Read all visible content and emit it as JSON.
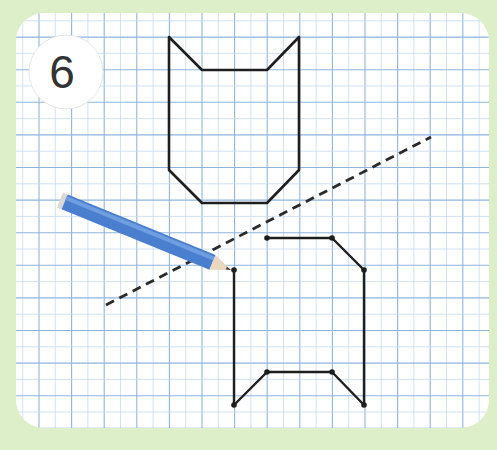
{
  "puzzle": {
    "number": "6",
    "caption": ""
  },
  "colors": {
    "background": "#dcefc9",
    "board": "#ffffff",
    "grid_major": "#8fb4de",
    "grid_minor": "#c5d9f0",
    "shape_stroke": "#1e1e1e",
    "dash_line": "#2a2a2a",
    "pencil_body": "#4a7fcf",
    "pencil_light": "#6f9ee0",
    "pencil_tip": "#e9d8bf",
    "badge": "#ffffff"
  },
  "grid": {
    "cell_size": 32.6,
    "origin_x": 39,
    "origin_y": 4.5
  },
  "shapes": {
    "original_cat_head": {
      "points": [
        [
          169,
          37
        ],
        [
          202,
          70
        ],
        [
          267,
          70
        ],
        [
          299,
          37
        ],
        [
          299,
          170
        ],
        [
          267,
          203
        ],
        [
          202,
          203
        ],
        [
          169,
          170
        ]
      ],
      "closed": true
    },
    "reflected_partial": {
      "points": [
        [
          267,
          238
        ],
        [
          332,
          238
        ],
        [
          364,
          270
        ],
        [
          364,
          405
        ],
        [
          332,
          372
        ],
        [
          267,
          372
        ],
        [
          234,
          405
        ],
        [
          234,
          270
        ]
      ],
      "dots": [
        [
          267,
          238
        ],
        [
          332,
          238
        ],
        [
          364,
          270
        ],
        [
          364,
          405
        ],
        [
          332,
          372
        ],
        [
          267,
          372
        ],
        [
          234,
          405
        ],
        [
          234,
          270
        ]
      ],
      "segments": [
        [
          [
            267,
            238
          ],
          [
            332,
            238
          ]
        ],
        [
          [
            332,
            238
          ],
          [
            364,
            270
          ]
        ],
        [
          [
            364,
            270
          ],
          [
            364,
            405
          ]
        ],
        [
          [
            364,
            405
          ],
          [
            332,
            372
          ]
        ],
        [
          [
            332,
            372
          ],
          [
            267,
            372
          ]
        ],
        [
          [
            267,
            372
          ],
          [
            234,
            405
          ]
        ],
        [
          [
            234,
            405
          ],
          [
            234,
            270
          ]
        ]
      ]
    },
    "mirror_line": {
      "from": [
        106,
        305
      ],
      "to": [
        431,
        137
      ],
      "style": "dashed"
    }
  },
  "pencil": {
    "tip": [
      231,
      270
    ],
    "tail": [
      60,
      200
    ]
  }
}
